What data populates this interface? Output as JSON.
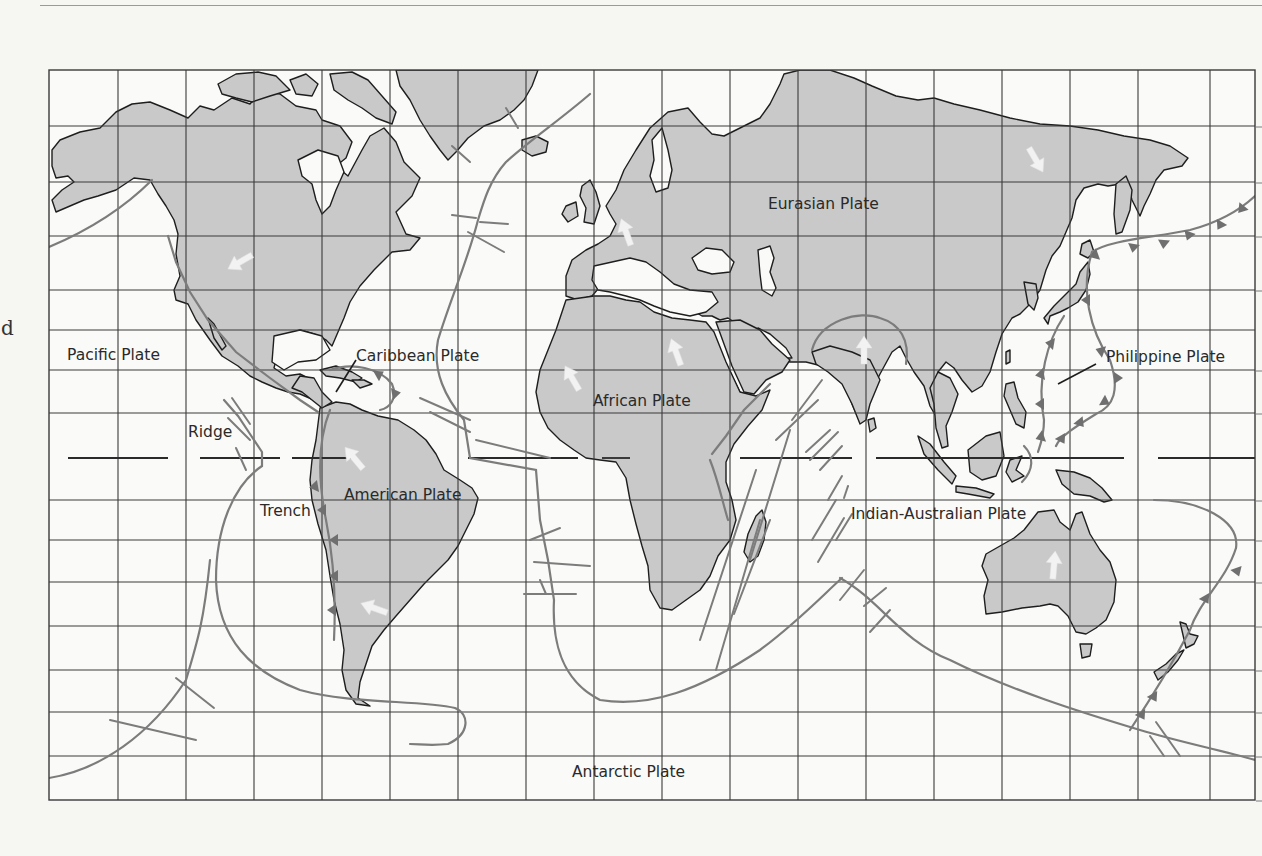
{
  "page": {
    "margin_text": "d"
  },
  "map": {
    "title": "World tectonic plates",
    "colors": {
      "background": "#f6f6f3",
      "land": "#c9c9c9",
      "coastline": "#1e1e1e",
      "grid": "#3a3a3a",
      "boundary": "#7c7c7c",
      "trench_teeth": "#6f6f6f",
      "arrow": "#f2f2f2",
      "label": "#2a2a2a"
    },
    "frame": {
      "left": 49,
      "top": 70,
      "right": 1255,
      "bottom": 800
    },
    "grid": {
      "columns_x": [
        118,
        186,
        254,
        322,
        390,
        458,
        526,
        594,
        662,
        730,
        798,
        866,
        934,
        1002,
        1070,
        1138,
        1210
      ],
      "rows_y": [
        126,
        182,
        236,
        290,
        330,
        370,
        413,
        500,
        540,
        582,
        626,
        670,
        712,
        756
      ]
    },
    "equator": {
      "y": 458,
      "style": "dashed"
    },
    "plate_labels": [
      {
        "id": "eurasian",
        "text": "Eurasian Plate",
        "x": 768,
        "y": 209
      },
      {
        "id": "pacific",
        "text": "Pacific Plate",
        "x": 67,
        "y": 360
      },
      {
        "id": "caribbean",
        "text": "Caribbean Plate",
        "x": 356,
        "y": 361
      },
      {
        "id": "philippine",
        "text": "Philippine Plate",
        "x": 1106,
        "y": 362
      },
      {
        "id": "african",
        "text": "African Plate",
        "x": 593,
        "y": 406
      },
      {
        "id": "american",
        "text": "American Plate",
        "x": 344,
        "y": 500
      },
      {
        "id": "indian-australian",
        "text": "Indian-Australian Plate",
        "x": 851,
        "y": 519
      },
      {
        "id": "antarctic",
        "text": "Antarctic Plate",
        "x": 572,
        "y": 777
      }
    ],
    "feature_labels": [
      {
        "id": "ridge",
        "text": "Ridge",
        "x": 188,
        "y": 437
      },
      {
        "id": "trench",
        "text": "Trench",
        "x": 260,
        "y": 516
      }
    ],
    "legend_meaning": {
      "ridge": "Line with perpendicular ticks (spreading ridge offset by transform faults)",
      "trench": "Line with triangular teeth (subduction trench)",
      "arrow": "Direction of plate motion"
    },
    "motion_arrows": [
      {
        "plate": "North American",
        "x": 240,
        "y": 262,
        "angle": 240
      },
      {
        "plate": "Eurasian (Europe)",
        "x": 626,
        "y": 232,
        "angle": -20
      },
      {
        "plate": "Eurasian (Siberia)",
        "x": 1036,
        "y": 160,
        "angle": 150
      },
      {
        "plate": "African (NW)",
        "x": 572,
        "y": 378,
        "angle": -30
      },
      {
        "plate": "African (NE)",
        "x": 676,
        "y": 352,
        "angle": -20
      },
      {
        "plate": "Indian",
        "x": 864,
        "y": 350,
        "angle": 0
      },
      {
        "plate": "South American (N)",
        "x": 354,
        "y": 458,
        "angle": -40
      },
      {
        "plate": "South American (S)",
        "x": 374,
        "y": 608,
        "angle": -70
      },
      {
        "plate": "Australian",
        "x": 1054,
        "y": 565,
        "angle": 5
      }
    ]
  }
}
